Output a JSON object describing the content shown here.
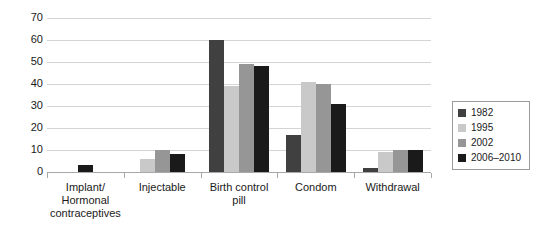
{
  "chart_data": {
    "type": "bar",
    "title": "",
    "subtitle": "",
    "xlabel": "",
    "ylabel": "",
    "ylim": [
      0,
      70
    ],
    "ytick_step": 10,
    "ytick_labels": [
      "0",
      "10",
      "20",
      "30",
      "40",
      "50",
      "60",
      "70"
    ],
    "grid": true,
    "legend_position": "right",
    "categories": [
      "Implant/ Hormonal contraceptives",
      "Injectable",
      "Birth control pill",
      "Condom",
      "Withdrawal"
    ],
    "category_label_lines": [
      [
        "Implant/",
        "Hormonal",
        "contraceptives"
      ],
      [
        "Injectable"
      ],
      [
        "Birth control",
        "pill"
      ],
      [
        "Condom"
      ],
      [
        "Withdrawal"
      ]
    ],
    "series": [
      {
        "name": "1982",
        "color": "#404040",
        "values": [
          null,
          null,
          60,
          17,
          2
        ]
      },
      {
        "name": "1995",
        "color": "#c9c9c9",
        "values": [
          null,
          6,
          39,
          41,
          9
        ]
      },
      {
        "name": "2002",
        "color": "#969696",
        "values": [
          null,
          10,
          49,
          40,
          10
        ]
      },
      {
        "name": "2006–2010",
        "color": "#1a1a1a",
        "values": [
          3,
          8,
          48,
          31,
          10
        ]
      }
    ]
  },
  "legend": {
    "entries": [
      {
        "label": "1982",
        "color": "#404040"
      },
      {
        "label": "1995",
        "color": "#c9c9c9"
      },
      {
        "label": "2002",
        "color": "#969696"
      },
      {
        "label": "2006–2010",
        "color": "#1a1a1a"
      }
    ]
  },
  "colors": {
    "background": "#ffffff",
    "gridline": "#d4d4d4",
    "axis": "#a8a8a8",
    "text": "#1a1a1a",
    "legend_border": "#9a9a9a"
  }
}
